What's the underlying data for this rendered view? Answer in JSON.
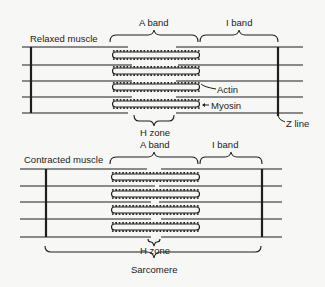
{
  "relaxed": {
    "title": "Relaxed muscle",
    "a_band": "A band",
    "i_band": "I band",
    "actin": "Actin",
    "myosin": "Myosin",
    "h_zone": "H zone",
    "z_line": "Z line"
  },
  "contracted": {
    "title": "Contracted muscle",
    "a_band": "A band",
    "i_band": "I band",
    "h_zone": "H zone",
    "sarcomere": "Sarcomere"
  },
  "colors": {
    "ink": "#1e1e1e",
    "background": "#f7f7f5"
  }
}
